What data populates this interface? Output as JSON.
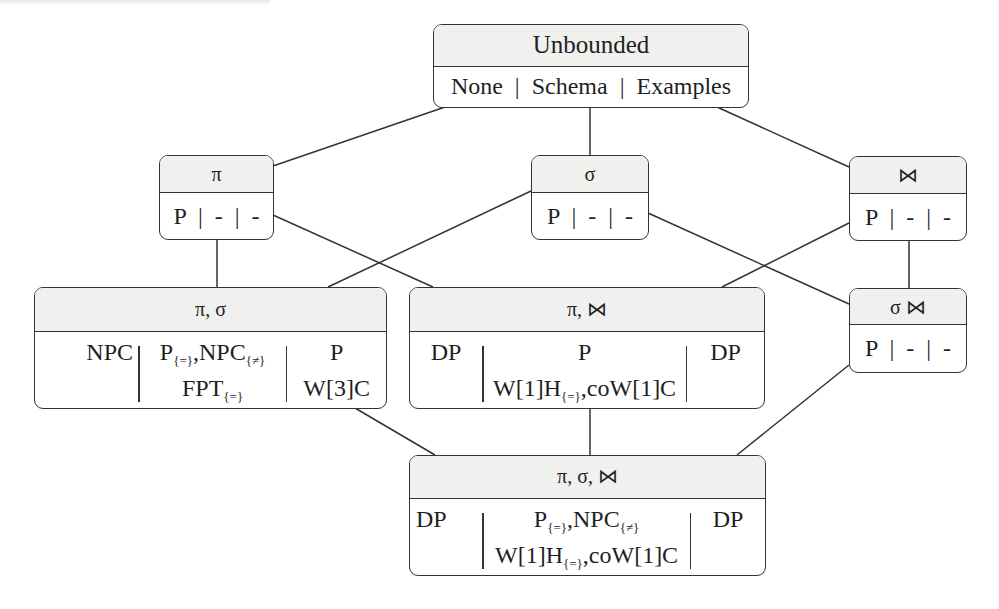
{
  "diagram": {
    "type": "lattice",
    "nodes": [
      {
        "id": "unbounded",
        "title": "Unbounded",
        "cells": [
          "None",
          "Schema",
          "Examples"
        ]
      },
      {
        "id": "pi",
        "title": "π",
        "cells": [
          "P",
          "-",
          "-"
        ]
      },
      {
        "id": "sigma",
        "title": "σ",
        "cells": [
          "P",
          "-",
          "-"
        ]
      },
      {
        "id": "join",
        "title": "⋈",
        "cells": [
          "P",
          "-",
          "-"
        ]
      },
      {
        "id": "pi-sigma",
        "title": "π, σ",
        "cells": [
          {
            "lines": [
              "NPC"
            ]
          },
          {
            "lines": [
              [
                {
                  "t": "P"
                },
                {
                  "sub": "{=}"
                },
                {
                  "t": ",NPC"
                },
                {
                  "sub": "{≠}"
                }
              ],
              [
                {
                  "t": "FPT"
                },
                {
                  "sub": "{=}"
                }
              ]
            ]
          },
          {
            "lines": [
              "P",
              "W[3]C"
            ]
          }
        ],
        "c1": "NPC",
        "c2_l1_a": "P",
        "c2_l1_a_sub": "{=}",
        "c2_l1_b": ",NPC",
        "c2_l1_b_sub": "{≠}",
        "c2_l2_a": "FPT",
        "c2_l2_a_sub": "{=}",
        "c3_l1": "P",
        "c3_l2": "W[3]C"
      },
      {
        "id": "pi-join",
        "title": "π, ⋈",
        "c1": "DP",
        "c2_l1": "P",
        "c2_l2_a": "W[1]H",
        "c2_l2_a_sub": "{=}",
        "c2_l2_b": ",coW[1]C",
        "c3": "DP"
      },
      {
        "id": "sigma-join",
        "title": "σ ⋈",
        "cells": [
          "P",
          "-",
          "-"
        ]
      },
      {
        "id": "pi-sigma-join",
        "title": "π, σ,  ⋈",
        "c1": "DP",
        "c2_l1_a": "P",
        "c2_l1_a_sub": "{=}",
        "c2_l1_b": ",NPC",
        "c2_l1_b_sub": "{≠}",
        "c2_l2_a": "W[1]H",
        "c2_l2_a_sub": "{=}",
        "c2_l2_b": ",coW[1]C",
        "c3": "DP"
      }
    ],
    "edges": [
      [
        "unbounded",
        "pi"
      ],
      [
        "unbounded",
        "sigma"
      ],
      [
        "unbounded",
        "join"
      ],
      [
        "pi",
        "pi-sigma"
      ],
      [
        "pi",
        "pi-join"
      ],
      [
        "sigma",
        "pi-sigma"
      ],
      [
        "sigma",
        "sigma-join"
      ],
      [
        "join",
        "pi-join"
      ],
      [
        "join",
        "sigma-join"
      ],
      [
        "pi-sigma",
        "pi-sigma-join"
      ],
      [
        "pi-join",
        "pi-sigma-join"
      ],
      [
        "sigma-join",
        "pi-sigma-join"
      ]
    ],
    "pipe": "|"
  },
  "node_map": {
    "unbounded": {
      "title": "Unbounded",
      "c1": "None",
      "c2": "Schema",
      "c3": "Examples"
    },
    "pi": {
      "title": "π",
      "c1": "P",
      "c2": "-",
      "c3": "-"
    },
    "sigma": {
      "title": "σ",
      "c1": "P",
      "c2": "-",
      "c3": "-"
    },
    "join": {
      "title": "⋈",
      "c1": "P",
      "c2": "-",
      "c3": "-"
    },
    "sigma_join": {
      "title": "σ ⋈",
      "c1": "P",
      "c2": "-",
      "c3": "-"
    },
    "pi_sigma": {
      "title": "π, σ",
      "c1": "NPC",
      "c2_l1_a": "P",
      "c2_l1_a_sub": "{=}",
      "c2_l1_b": ",NPC",
      "c2_l1_b_sub": "{≠}",
      "c2_l2_a": "FPT",
      "c2_l2_a_sub": "{=}",
      "c3_l1": "P",
      "c3_l2": "W[3]C"
    },
    "pi_join": {
      "title": "π, ⋈",
      "c1": "DP",
      "c2_l1": "P",
      "c2_l2_a": "W[1]H",
      "c2_l2_a_sub": "{=}",
      "c2_l2_b": ",coW[1]C",
      "c3": "DP"
    },
    "pi_sigma_join": {
      "title": "π, σ,  ⋈",
      "c1": "DP",
      "c2_l1_a": "P",
      "c2_l1_a_sub": "{=}",
      "c2_l1_b": ",NPC",
      "c2_l1_b_sub": "{≠}",
      "c2_l2_a": "W[1]H",
      "c2_l2_a_sub": "{=}",
      "c2_l2_b": ",coW[1]C",
      "c3": "DP"
    }
  },
  "colors": {
    "stroke": "#333333",
    "header_fill": "#f0f0ef",
    "body_fill": "#ffffff",
    "text": "#1f1f1f"
  }
}
